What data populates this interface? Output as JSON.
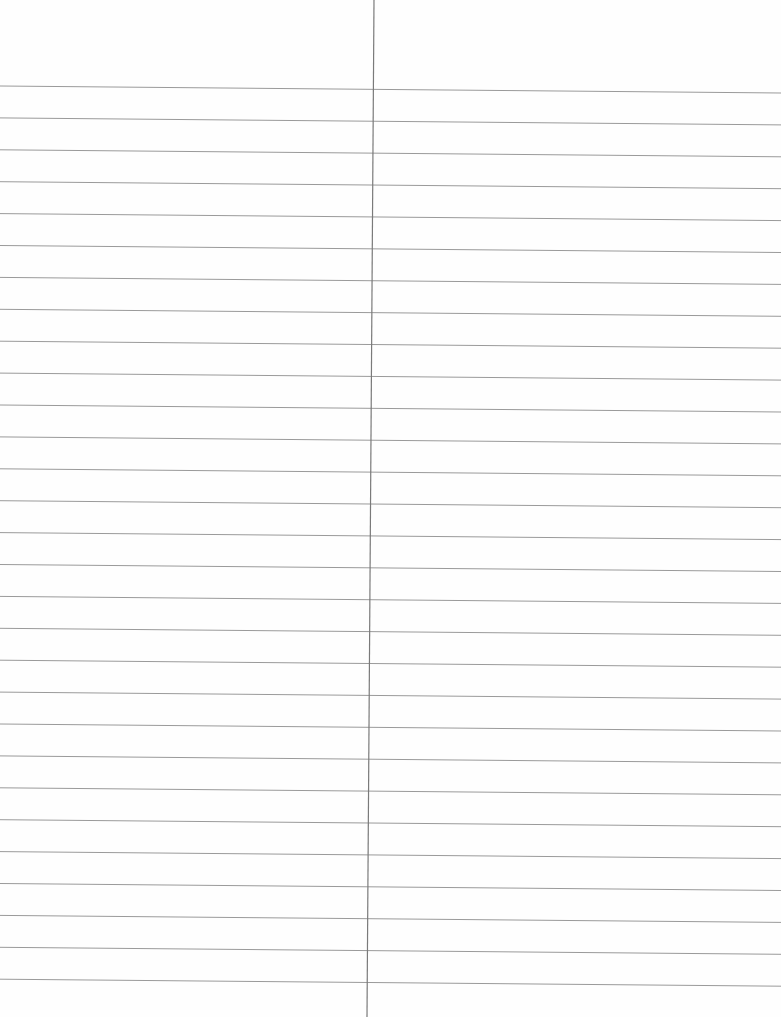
{
  "document": {
    "type": "blank lined paper",
    "columns": 2,
    "title": ""
  },
  "ruling": {
    "line_count": 29,
    "first_line_y_left": 86,
    "first_line_y_right": 93,
    "line_spacing": 31.9,
    "line_color": "#9a9a9a",
    "divider_color": "#7a7a7a",
    "divider_x_top": 374,
    "divider_x_bottom": 367,
    "paper_color": "#fefefe"
  },
  "columns": [
    {
      "name": "left-column",
      "text": ""
    },
    {
      "name": "right-column",
      "text": ""
    }
  ]
}
